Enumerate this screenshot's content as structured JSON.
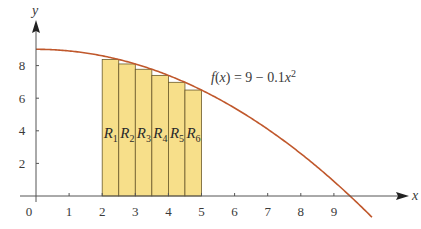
{
  "chart_data": {
    "type": "line",
    "title": "",
    "xlabel": "x",
    "ylabel": "y",
    "xlim": [
      0,
      10
    ],
    "ylim": [
      0,
      9.5
    ],
    "grid": false,
    "x_ticks": [
      "0",
      "1",
      "2",
      "3",
      "4",
      "5",
      "6",
      "7",
      "8",
      "9"
    ],
    "y_ticks": [
      "2",
      "4",
      "6",
      "8"
    ],
    "function": {
      "label": "f(x) = 9 − 0.1x²",
      "expression": "9 - 0.1*x^2",
      "color": "#c0582c"
    },
    "rectangles": {
      "fill": "#f7df8a",
      "stroke": "#6b5a2a",
      "width": 0.5,
      "method": "right-endpoint",
      "items": [
        {
          "label": "R",
          "sub": "1",
          "x0": 2.0,
          "x1": 2.5,
          "height": 8.375
        },
        {
          "label": "R",
          "sub": "2",
          "x0": 2.5,
          "x1": 3.0,
          "height": 8.1
        },
        {
          "label": "R",
          "sub": "3",
          "x0": 3.0,
          "x1": 3.5,
          "height": 7.775
        },
        {
          "label": "R",
          "sub": "4",
          "x0": 3.5,
          "x1": 4.0,
          "height": 7.4
        },
        {
          "label": "R",
          "sub": "5",
          "x0": 4.0,
          "x1": 4.5,
          "height": 6.975
        },
        {
          "label": "R",
          "sub": "6",
          "x0": 4.5,
          "x1": 5.0,
          "height": 6.5
        }
      ]
    }
  }
}
